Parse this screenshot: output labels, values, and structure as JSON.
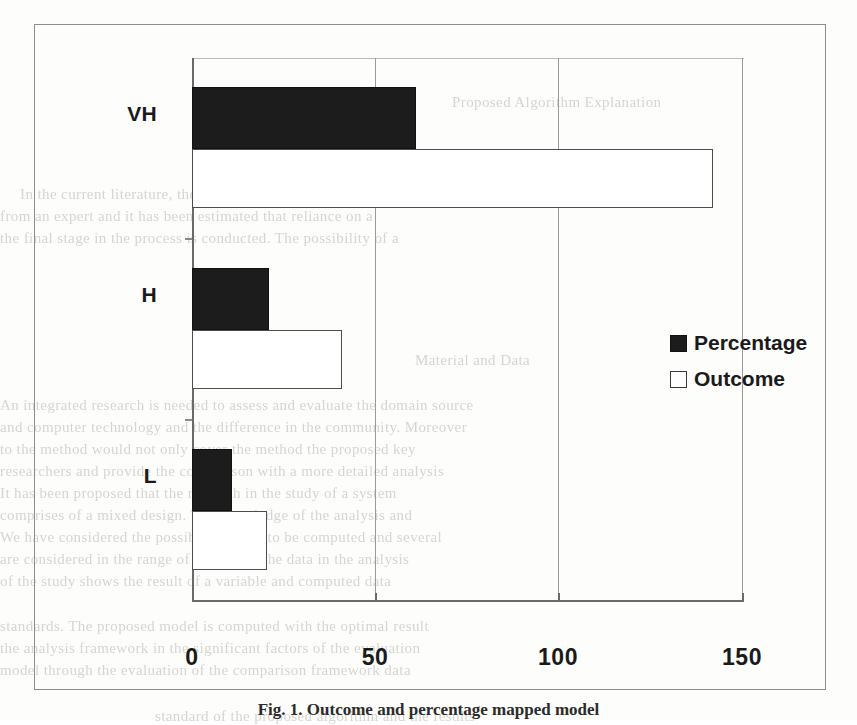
{
  "figure": {
    "caption": "Fig. 1.  Outcome and percentage mapped model",
    "frame_color": "#8d8d8d"
  },
  "legend": {
    "position": "inside-right",
    "items": [
      {
        "label": "Percentage",
        "swatch": "filled-square",
        "color": "#1c1c1c"
      },
      {
        "label": "Outcome",
        "swatch": "hollow-square",
        "color": "#ffffff"
      }
    ]
  },
  "axis": {
    "x_tick_labels": [
      "0",
      "50",
      "100",
      "150"
    ],
    "y_tick_labels": [
      "VH",
      "H",
      "L"
    ]
  },
  "chart_data": {
    "type": "bar",
    "orientation": "horizontal",
    "title": "",
    "subtitle": "",
    "xlabel": "",
    "ylabel": "",
    "categories": [
      "VH",
      "H",
      "L"
    ],
    "series": [
      {
        "name": "Percentage",
        "values": [
          61,
          21,
          11
        ],
        "color": "#1c1c1c",
        "style": "filled"
      },
      {
        "name": "Outcome",
        "values": [
          142,
          41,
          20
        ],
        "color": "#ffffff",
        "style": "hollow-outlined"
      }
    ],
    "xlim": [
      0,
      150
    ],
    "xticks": [
      0,
      50,
      100,
      150
    ],
    "grid": "vertical-only",
    "legend_position": "inside-right",
    "annotations": []
  },
  "bleed_text": [
    {
      "x": 452,
      "y": 94,
      "text": "Proposed Algorithm Explanation"
    },
    {
      "x": 20,
      "y": 186,
      "text": "In the current literature, the majority of the works aim to highlight a flaw"
    },
    {
      "x": 0,
      "y": 208,
      "text": "from an expert and it has been estimated that reliance on a"
    },
    {
      "x": 0,
      "y": 230,
      "text": "the final stage in the process is conducted. The possibility of a"
    },
    {
      "x": 415,
      "y": 352,
      "text": "Material and Data"
    },
    {
      "x": 0,
      "y": 397,
      "text": "An integrated research is needed to assess and evaluate the domain source"
    },
    {
      "x": 0,
      "y": 419,
      "text": "and computer technology and the difference in the community. Moreover"
    },
    {
      "x": 0,
      "y": 441,
      "text": "to the method would not only cover the method the proposed key"
    },
    {
      "x": 0,
      "y": 463,
      "text": "researchers and provide the comparison with a more detailed analysis"
    },
    {
      "x": 0,
      "y": 485,
      "text": "It has been proposed that the research in the study of a system"
    },
    {
      "x": 0,
      "y": 507,
      "text": "comprises of a mixed design. The knowledge of the analysis and"
    },
    {
      "x": 0,
      "y": 529,
      "text": "We have considered the possible variable to be computed and several"
    },
    {
      "x": 0,
      "y": 551,
      "text": "are considered in the range of a sample. The data in the analysis"
    },
    {
      "x": 0,
      "y": 573,
      "text": "of the study shows the result of a variable and computed data"
    },
    {
      "x": 0,
      "y": 618,
      "text": "standards. The proposed model is computed with the optimal result"
    },
    {
      "x": 0,
      "y": 640,
      "text": "the analysis framework in the significant factors of the evaluation"
    },
    {
      "x": 0,
      "y": 662,
      "text": "model through the evaluation of the comparison framework data"
    },
    {
      "x": 155,
      "y": 708,
      "text": "standard of the proposed algorithm and the results"
    }
  ]
}
